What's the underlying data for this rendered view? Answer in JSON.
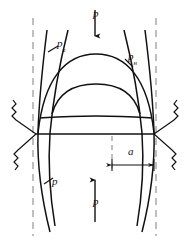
{
  "figure": {
    "type": "mechanics-diagram",
    "background_color": "#ffffff",
    "line_color": "#111111",
    "dashed_color": "#8a8a8a",
    "labels": {
      "load_top": "p",
      "load_bottom": "p",
      "curve_left_upper": "p",
      "curve_left_upper_sub": "в",
      "curve_right_upper": "p",
      "curve_right_upper_sub": "н",
      "curve_lower_left": "p",
      "dimension_a": "a"
    },
    "arrows": {
      "top": {
        "direction": "down",
        "label": "p"
      },
      "bottom": {
        "direction": "up",
        "label": "p"
      },
      "dimension": {
        "direction": "both",
        "label": "a"
      }
    },
    "supports": {
      "left": {
        "type": "spring-pair",
        "count": 2
      },
      "right": {
        "type": "spring-pair",
        "count": 2
      }
    },
    "guides": {
      "vertical_dashed_left_x": 33,
      "vertical_dashed_right_x": 156,
      "center_dashed_x": 112,
      "baseline_y": 134
    }
  }
}
